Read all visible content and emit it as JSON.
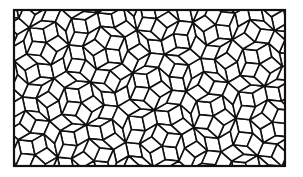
{
  "figure": {
    "type": "rhombus-tiling",
    "frame": {
      "x": 14,
      "y": 10,
      "width": 271,
      "height": 156
    },
    "edge_length": 14,
    "colors": {
      "stroke": "#111111",
      "fill": "#ffffff",
      "background": "#ffffff"
    }
  }
}
